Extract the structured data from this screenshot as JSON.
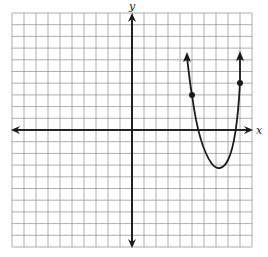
{
  "chart_data": {
    "type": "line",
    "title": "",
    "xlabel": "x",
    "ylabel": "y",
    "xlim": [
      -10,
      10
    ],
    "ylim": [
      -10,
      10
    ],
    "grid": true,
    "grid_step": 1,
    "axes_arrows": true,
    "curve": {
      "description": "U-shaped curve opening upward with arrows at both ends",
      "points": [
        {
          "x": 4.6,
          "y": 6.3
        },
        {
          "x": 5,
          "y": 3
        },
        {
          "x": 6,
          "y": -1.8
        },
        {
          "x": 7.2,
          "y": -3.2
        },
        {
          "x": 8.2,
          "y": -2
        },
        {
          "x": 8.7,
          "y": 0
        },
        {
          "x": 9,
          "y": 4
        },
        {
          "x": 9,
          "y": 6.3
        }
      ],
      "marked_points": [
        {
          "x": 5,
          "y": 3
        },
        {
          "x": 9,
          "y": 4
        }
      ],
      "vertex_approx": {
        "x": 7.2,
        "y": -3.2
      },
      "x_intercepts_approx": [
        5.8,
        8.7
      ]
    }
  },
  "labels": {
    "x_axis": "x",
    "y_axis": "y"
  },
  "colors": {
    "grid": "#9a9a9a",
    "axis": "#1a1a1a",
    "curve": "#1a1a1a"
  }
}
